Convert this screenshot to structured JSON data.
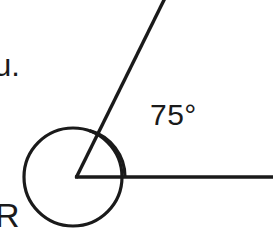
{
  "figure": {
    "background_color": "#ffffff",
    "stroke_color": "#1a1a1a",
    "stroke_width": 3.2,
    "vertex": {
      "x": 77,
      "y": 177
    },
    "rays": [
      {
        "name": "horizontal-ray",
        "from": {
          "x": 77,
          "y": 177
        },
        "to": {
          "x": 273,
          "y": 177
        },
        "direction_degrees": 0
      },
      {
        "name": "slanted-ray",
        "from": {
          "x": 77,
          "y": 177
        },
        "to": {
          "x": 165,
          "y": 0
        },
        "direction_degrees": 75
      }
    ],
    "angle_arc": {
      "name": "acute-angle-arc",
      "radius": 48,
      "start_degrees": 0,
      "end_degrees": 75,
      "measure_degrees": 75
    },
    "reflex_circle": {
      "name": "reflex-angle-circle",
      "center": {
        "x": 73,
        "y": 177
      },
      "radius": 49,
      "measure_degrees": 285
    }
  },
  "labels": {
    "angle_value": "75°",
    "text_fragment_top": "u.",
    "text_fragment_bottom": "R"
  }
}
